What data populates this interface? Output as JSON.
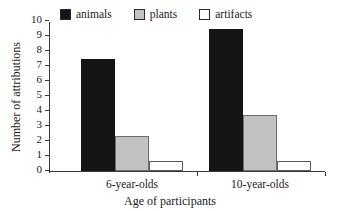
{
  "chart_data": {
    "type": "bar",
    "title": "",
    "subtitle": "",
    "xlabel": "Age of participants",
    "ylabel": "Number of attributions",
    "categories": [
      "6-year-olds",
      "10-year-olds"
    ],
    "series": [
      {
        "name": "animals",
        "color": "#141414",
        "values": [
          7.5,
          9.5
        ]
      },
      {
        "name": "plants",
        "color": "#c2c2c2",
        "values": [
          2.35,
          3.75
        ]
      },
      {
        "name": "artifacts",
        "color": "#ffffff",
        "values": [
          0.7,
          0.65
        ]
      }
    ],
    "ylim": [
      0,
      10
    ],
    "yticks": [
      0,
      1,
      2,
      3,
      4,
      5,
      6,
      7,
      8,
      9,
      10
    ],
    "ytick_labels": [
      "0",
      "1",
      "2",
      "3",
      "4",
      "5",
      "6",
      "7",
      "8",
      "9",
      "10"
    ],
    "grid": false,
    "legend_position": "top"
  },
  "legend": {
    "entries": [
      {
        "label": "animals",
        "swatch": "legend-swatch-animals"
      },
      {
        "label": "plants",
        "swatch": "legend-swatch-plants"
      },
      {
        "label": "artifacts",
        "swatch": "legend-swatch-artifacts"
      }
    ]
  }
}
